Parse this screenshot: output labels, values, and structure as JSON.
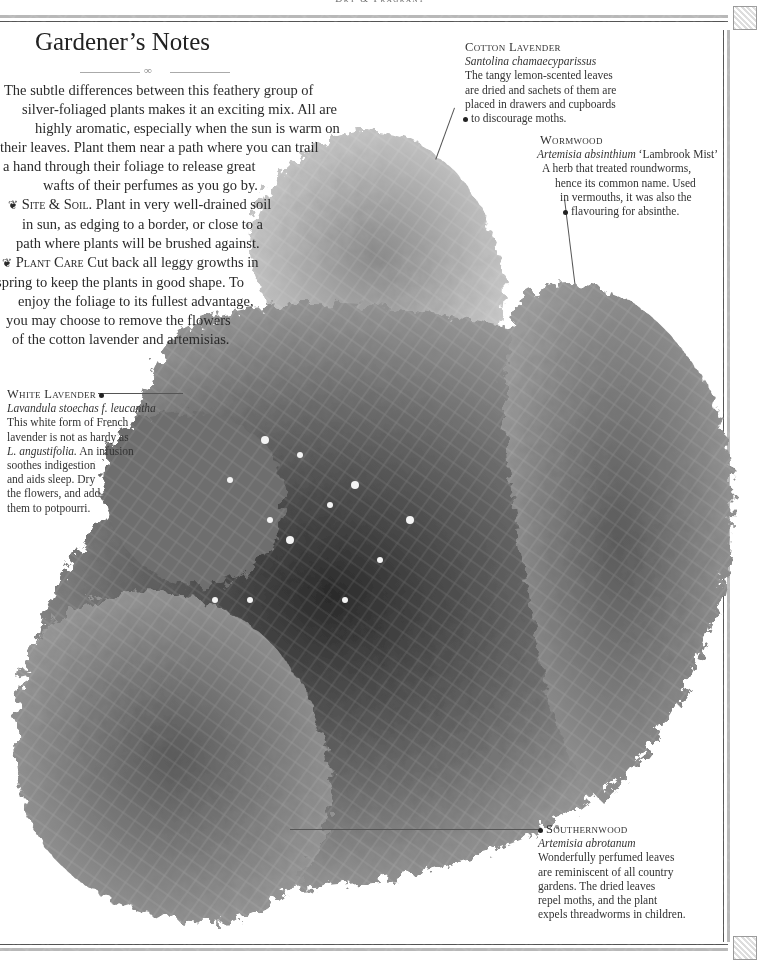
{
  "running_head": "Dry & Fragrant",
  "title": "Gardener’s Notes",
  "intro": {
    "lines": [
      "The subtle differences between this feathery group of",
      "silver-foliaged plants makes it an exciting mix. All are",
      "highly aromatic, especially when the sun is warm on",
      "their leaves. Plant them near a path where you can trail",
      "a hand through their foliage to release great",
      "wafts of their perfumes as you go by."
    ],
    "site_soil": {
      "label": "Site & Soil.",
      "lines": [
        "Plant in very well-drained soil",
        "in sun, as edging to a border, or close to a",
        "path where plants will be brushed against."
      ]
    },
    "plant_care": {
      "label": "Plant Care",
      "lines": [
        "Cut back all leggy growths in",
        "spring to keep the plants in good shape. To",
        "enjoy the foliage to its fullest advantage,",
        "you may choose to remove the flowers",
        "of the cotton lavender and artemisias."
      ]
    },
    "bullet_icon": "leaf-bullet-icon"
  },
  "callouts": {
    "cotton_lavender": {
      "name": "Cotton Lavender",
      "latin": "Santolina chamaecyparissus",
      "lines": [
        "The tangy lemon-scented leaves",
        "are dried and sachets of them are",
        "placed in drawers and cupboards",
        "to discourage moths."
      ]
    },
    "wormwood": {
      "name": "Wormwood",
      "latin": "Artemisia absinthium",
      "cultivar": "‘Lambrook Mist’",
      "lines": [
        "A herb that treated roundworms,",
        "hence its common name. Used",
        "in vermouths, it was also the",
        "flavouring for absinthe."
      ]
    },
    "white_lavender": {
      "name": "White Lavender",
      "latin": "Lavandula stoechas f. leucantha",
      "line1": "This white form of French",
      "line2": "lavender is not as hardy as",
      "line3_latin": "L. angustifolia.",
      "line3_rest": " An infusion",
      "lines_rest": [
        "soothes indigestion",
        "and aids sleep. Dry",
        "the flowers, and add",
        "them to potpourri."
      ]
    },
    "southernwood": {
      "name": "Southernwood",
      "latin": "Artemisia abrotanum",
      "lines": [
        "Wonderfully perfumed leaves",
        "are reminiscent of all country",
        "gardens. The dried leaves",
        "repel moths, and the plant",
        "expels threadworms in children."
      ]
    }
  },
  "colors": {
    "text": "#2a2a2a",
    "rule_dark": "#555555",
    "rule_light": "#b8b8b8",
    "foliage_dark": "#2e2e2e",
    "foliage_mid": "#7a7a7a",
    "foliage_light": "#c4c4c4"
  }
}
